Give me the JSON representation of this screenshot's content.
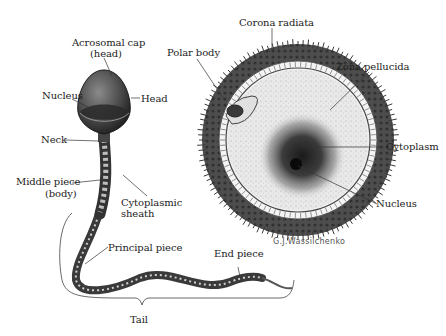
{
  "figure": {
    "sperm": {
      "labels": {
        "acrosomal_cap_line1": "Acrosomal cap",
        "acrosomal_cap_line2": "(head)",
        "head": "Head",
        "nucleus": "Nucleus",
        "neck": "Neck",
        "middle_piece_line1": "Middle piece",
        "middle_piece_line2": "(body)",
        "cytoplasmic_sheath_line1": "Cytoplasmic",
        "cytoplasmic_sheath_line2": "sheath",
        "principal_piece": "Principal piece",
        "end_piece": "End piece",
        "tail": "Tail"
      }
    },
    "ovum": {
      "labels": {
        "corona_radiata": "Corona radiata",
        "polar_body": "Polar body",
        "zona_pellucida": "Zona pellucida",
        "cytoplasm": "Cytoplasm",
        "nucleus": "Nucleus"
      }
    },
    "signature": "G.J.Wassilchenko"
  }
}
